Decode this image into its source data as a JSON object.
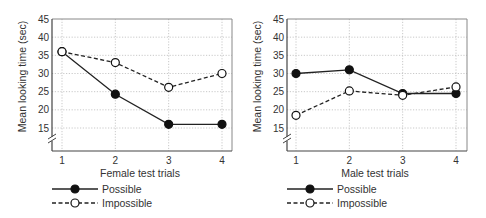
{
  "chart_data": [
    {
      "type": "line",
      "title": "",
      "xlabel": "Female test trials",
      "ylabel": "Mean looking time (sec)",
      "x": [
        1,
        2,
        3,
        4
      ],
      "categories": [
        "1",
        "2",
        "3",
        "4"
      ],
      "yticks": [
        15,
        20,
        25,
        30,
        35,
        40,
        45
      ],
      "ylim": [
        10,
        45
      ],
      "axis_break": true,
      "grid": true,
      "legend_position": "bottom",
      "series": [
        {
          "name": "Possible",
          "style": "solid",
          "marker": "filled-circle",
          "values": [
            36,
            24.3,
            16,
            16
          ]
        },
        {
          "name": "Impossible",
          "style": "dashed",
          "marker": "open-circle",
          "values": [
            36,
            33,
            26.2,
            30
          ]
        }
      ]
    },
    {
      "type": "line",
      "title": "",
      "xlabel": "Male test trials",
      "ylabel": "Mean looking time (sec)",
      "x": [
        1,
        2,
        3,
        4
      ],
      "categories": [
        "1",
        "2",
        "3",
        "4"
      ],
      "yticks": [
        15,
        20,
        25,
        30,
        35,
        40,
        45
      ],
      "ylim": [
        10,
        45
      ],
      "axis_break": true,
      "grid": true,
      "legend_position": "bottom",
      "series": [
        {
          "name": "Possible",
          "style": "solid",
          "marker": "filled-circle",
          "values": [
            30,
            31,
            24.5,
            24.5
          ]
        },
        {
          "name": "Impossible",
          "style": "dashed",
          "marker": "open-circle",
          "values": [
            18.5,
            25.2,
            24,
            26.3
          ]
        }
      ]
    }
  ],
  "colors": {
    "line": "#222222",
    "grid": "#bbbbbb",
    "axis": "#444444",
    "text": "#333333"
  }
}
